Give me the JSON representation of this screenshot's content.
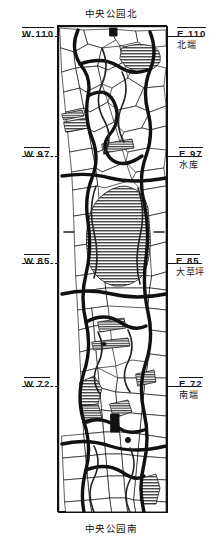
{
  "captions": {
    "top": "中央公园北",
    "bottom": "中央公园南"
  },
  "left_labels": [
    {
      "code": "W 110"
    },
    {
      "code": "W 97"
    },
    {
      "code": "W 85"
    },
    {
      "code": "W 72"
    }
  ],
  "right_labels": [
    {
      "code": "E 110",
      "sub": "北端"
    },
    {
      "code": "E 97",
      "sub": "水库"
    },
    {
      "code": "E 85",
      "sub": "大草坪"
    },
    {
      "code": "E 72",
      "sub": "南端"
    }
  ],
  "map": {
    "title": "中央公园",
    "ink_color": "#111111",
    "water_fill": "#8a8a8a",
    "paper_color": "#ffffff"
  }
}
